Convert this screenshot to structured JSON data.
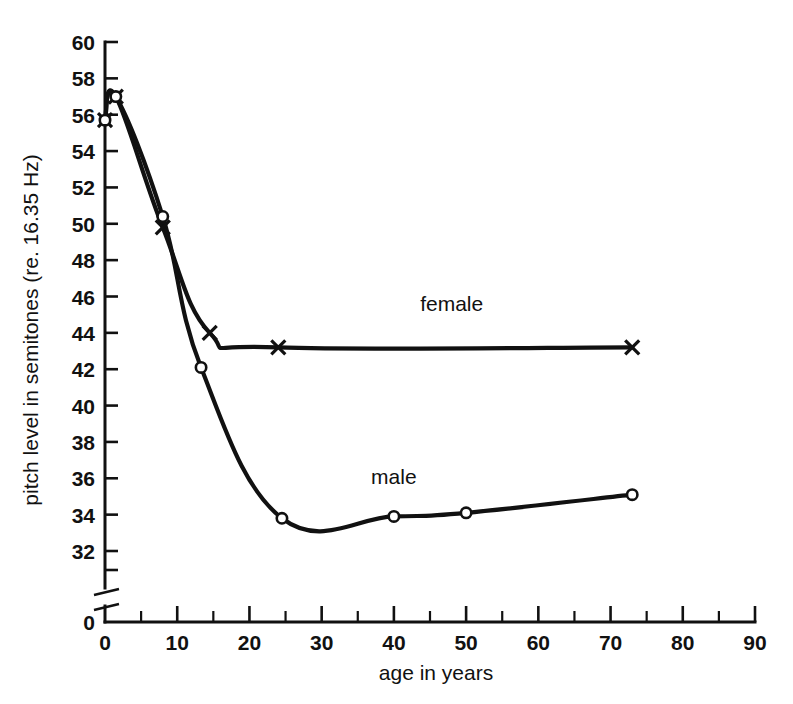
{
  "chart_data": {
    "type": "line",
    "title": "",
    "xlabel": "age  in  years",
    "ylabel": "pitch level in semitones (re. 16.35 Hz)",
    "xlim": [
      0,
      90
    ],
    "ylim": [
      32,
      60
    ],
    "y_axis_break": true,
    "y_break_label": "0",
    "grid": false,
    "legend_position": "inline-annotation",
    "x_ticks": [
      0,
      10,
      20,
      30,
      40,
      50,
      60,
      70,
      80,
      90
    ],
    "x_tick_labels": [
      "0",
      "10",
      "20",
      "30",
      "40",
      "50",
      "60",
      "70",
      "80",
      "90"
    ],
    "x_minor_ticks": [
      5,
      15,
      25,
      35,
      45,
      55,
      65,
      75,
      85
    ],
    "y_ticks": [
      32,
      34,
      36,
      38,
      40,
      42,
      44,
      46,
      48,
      50,
      52,
      54,
      56,
      58,
      60
    ],
    "y_tick_labels": [
      "32",
      "34",
      "36",
      "38",
      "40",
      "42",
      "44",
      "46",
      "48",
      "50",
      "52",
      "54",
      "56",
      "58",
      "60"
    ],
    "series": [
      {
        "name": "female",
        "marker": "x",
        "label": "female",
        "label_x": 48.0,
        "label_y": 45.2,
        "x": [
          0,
          1.5,
          8,
          14.5,
          24,
          73
        ],
        "y": [
          55.7,
          57.0,
          49.8,
          44.0,
          43.2,
          43.2
        ]
      },
      {
        "name": "male",
        "marker": "o",
        "label": "male",
        "label_x": 40.0,
        "label_y": 35.7,
        "x": [
          0,
          1.5,
          8,
          13.3,
          24.5,
          40,
          50,
          73
        ],
        "y": [
          55.7,
          57.0,
          50.4,
          42.1,
          33.8,
          33.9,
          34.1,
          35.1
        ]
      }
    ]
  },
  "figure": {
    "background": "#ffffff",
    "ink_color": "#111111"
  }
}
